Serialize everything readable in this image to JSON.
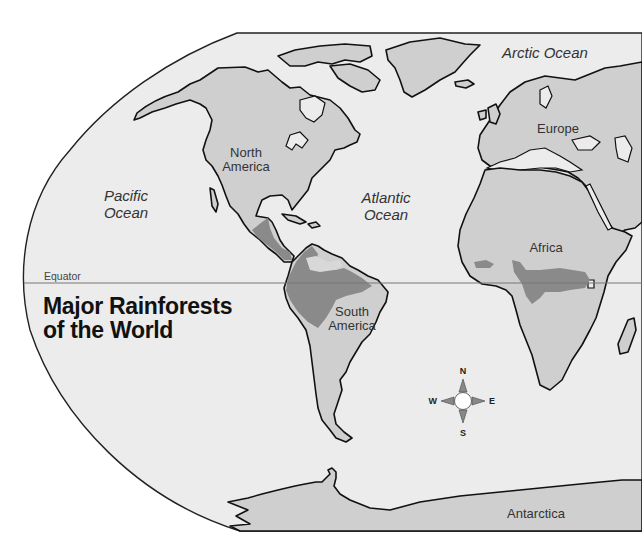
{
  "title": {
    "line1": "Major Rainforests",
    "line2": "of the World"
  },
  "equator_label": "Equator",
  "oceans": {
    "pacific": [
      "Pacific",
      "Ocean"
    ],
    "atlantic": [
      "Atlantic",
      "Ocean"
    ],
    "arctic": "Arctic Ocean"
  },
  "continents": {
    "north_america": [
      "North",
      "America"
    ],
    "south_america": [
      "South",
      "America"
    ],
    "europe": "Europe",
    "africa": "Africa",
    "antarctica": "Antarctica"
  },
  "compass": {
    "n": "N",
    "s": "S",
    "e": "E",
    "w": "W"
  },
  "legend_colors": {
    "ocean": "#ececec",
    "land": "#cfcfcf",
    "rainforest": "#8a8a8a"
  },
  "rainforest_regions": [
    "Central America",
    "Amazon Basin (South America)",
    "West Africa",
    "Congo Basin (Central Africa)"
  ]
}
